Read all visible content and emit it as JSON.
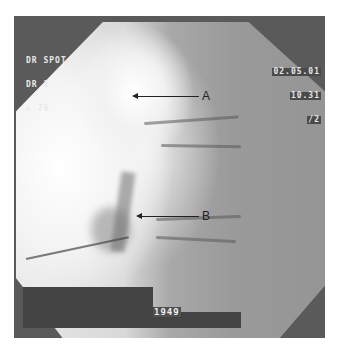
{
  "image": {
    "type": "fluoroscopy-spot-image",
    "description": "Lateral fluoroscopic radiograph of the spine with needle and labeled arrows"
  },
  "overlay": {
    "top_left": [
      "DR SPOT",
      "DR 1",
      "◇ 76"
    ],
    "top_right": [
      "02.05.01",
      "10.31",
      "/2"
    ],
    "bottom_label": "1949"
  },
  "annotations": [
    {
      "label": "A",
      "description": "arrow pointing left toward bright vertebral region (upper)"
    },
    {
      "label": "B",
      "description": "arrow pointing left toward needle tip / disc region (lower)"
    }
  ],
  "colors": {
    "background": "#ffffff",
    "frame": "#5a5a5a",
    "overlay_bar": "#434343",
    "overlay_text": "#e8e8e8",
    "annotation": "#222222"
  }
}
